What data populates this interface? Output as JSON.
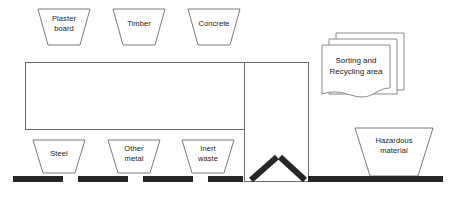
{
  "diagram": {
    "background_color": "#ffffff",
    "outline_color": "#6b6b6b",
    "bar_color": "#262626",
    "top_hoppers": [
      {
        "id": "plaster-board",
        "label": "Plaster\nboard",
        "x": 38,
        "y": 9,
        "top_width": 52,
        "bottom_width": 32,
        "height": 36
      },
      {
        "id": "timber",
        "label": "Timber",
        "x": 113,
        "y": 9,
        "top_width": 52,
        "bottom_width": 32,
        "height": 36
      },
      {
        "id": "concrete",
        "label": "Concrete",
        "x": 188,
        "y": 9,
        "top_width": 52,
        "bottom_width": 32,
        "height": 36
      }
    ],
    "bottom_hoppers": [
      {
        "id": "steel",
        "label": "Steel",
        "x": 33,
        "y": 140,
        "top_width": 52,
        "bottom_width": 32,
        "height": 33
      },
      {
        "id": "other-metal",
        "label": "Other\nmetal",
        "x": 108,
        "y": 140,
        "top_width": 52,
        "bottom_width": 32,
        "height": 33
      },
      {
        "id": "inert-waste",
        "label": "Inert\nwaste",
        "x": 182,
        "y": 140,
        "top_width": 52,
        "bottom_width": 32,
        "height": 33
      },
      {
        "id": "hazardous-material",
        "label": "Hazardous\nmaterial",
        "x": 355,
        "y": 128,
        "top_width": 78,
        "bottom_width": 48,
        "height": 48
      }
    ],
    "document_stack": {
      "id": "sorting-recycling-area",
      "label": "Sorting and\nRecycling area",
      "x": 322,
      "y": 33,
      "width": 82,
      "height": 62,
      "sheets": 3,
      "sheet_offset": 7
    },
    "main_building": {
      "id": "sorting-hall",
      "x": 25,
      "y": 62,
      "width": 219,
      "height": 67
    },
    "right_column": {
      "id": "transfer-bay",
      "x": 244,
      "y": 62,
      "width": 64,
      "height": 119
    },
    "floor_dashes": [
      {
        "x": 13,
        "y": 176,
        "width": 50,
        "height": 6
      },
      {
        "x": 78,
        "y": 176,
        "width": 50,
        "height": 6
      },
      {
        "x": 143,
        "y": 176,
        "width": 50,
        "height": 6
      },
      {
        "x": 208,
        "y": 176,
        "width": 35,
        "height": 6
      },
      {
        "x": 308,
        "y": 176,
        "width": 135,
        "height": 6
      }
    ],
    "funnel_arms": [
      {
        "id": "funnel-arm-left",
        "x1": 251,
        "y1": 179,
        "x2": 277,
        "y2": 157
      },
      {
        "id": "funnel-arm-right",
        "x1": 305,
        "y1": 179,
        "x2": 280,
        "y2": 157
      }
    ]
  }
}
